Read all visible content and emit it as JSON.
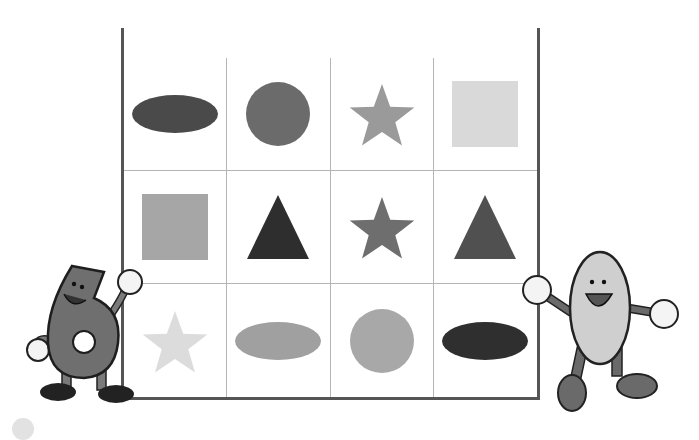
{
  "board": {
    "title": "PLAYER B",
    "header_color": "#5a5a5a",
    "rows": [
      [
        {
          "shape": "ellipse",
          "fill": "#4a4a4a"
        },
        {
          "shape": "circle",
          "fill": "#6b6b6b"
        },
        {
          "shape": "star",
          "fill": "#9a9a9a"
        },
        {
          "shape": "square",
          "fill": "#d9d9d9"
        }
      ],
      [
        {
          "shape": "square",
          "fill": "#a6a6a6"
        },
        {
          "shape": "triangle",
          "fill": "#2e2e2e"
        },
        {
          "shape": "star",
          "fill": "#6e6e6e"
        },
        {
          "shape": "triangle",
          "fill": "#505050"
        }
      ],
      [
        {
          "shape": "star",
          "fill": "#dcdcdc"
        },
        {
          "shape": "ellipse",
          "fill": "#a0a0a0"
        },
        {
          "shape": "circle",
          "fill": "#a8a8a8"
        },
        {
          "shape": "ellipse",
          "fill": "#2f2f2f"
        }
      ]
    ]
  },
  "characters": [
    {
      "name": "number-six-mascot",
      "label": "6"
    },
    {
      "name": "number-zero-mascot",
      "label": "0"
    }
  ]
}
